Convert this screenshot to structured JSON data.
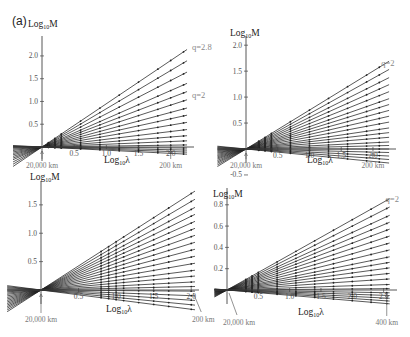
{
  "figure": {
    "label": "(a)"
  },
  "chart_data": [
    {
      "type": "line",
      "panel": "top-left",
      "ylabel": "Log10M",
      "xlabel": "Log10λ",
      "xlim": [
        -0.45,
        2.3
      ],
      "ylim": [
        -0.2,
        2.35
      ],
      "xticks": [
        0.5,
        1.0,
        1.5,
        2.0
      ],
      "xtick_labels": [
        "0.5",
        "1.0",
        "1.5",
        "2.0"
      ],
      "yticks": [
        0.5,
        1.0,
        1.5,
        2.0
      ],
      "ytick_labels": [
        "0.5",
        "1.0",
        "1.5",
        "2.0"
      ],
      "annotations": [
        {
          "text": "q=2.8",
          "x": 2.3,
          "y": 2.2
        },
        {
          "text": "q=2",
          "x": 2.3,
          "y": 1.15
        },
        {
          "text": "20,000 km",
          "x": 0.0,
          "arrow": "up"
        },
        {
          "text": "200 km",
          "x": 2.0,
          "arrow": "up"
        }
      ],
      "series_description": "Fan of straight lines through origin (Log10λ=0, Log10M=0); slopes range from about -0.08 to 0.95 (q from ~1 to 2.8); dots mark sample points",
      "slopes": [
        0.95,
        0.84,
        0.73,
        0.62,
        0.54,
        0.46,
        0.38,
        0.31,
        0.24,
        0.17,
        0.11,
        0.06,
        0.02,
        -0.01,
        -0.03,
        -0.05,
        -0.07
      ],
      "sample_x": [
        0.1,
        0.2,
        0.3,
        0.6,
        0.9,
        1.2,
        1.5,
        1.8,
        2.0,
        2.2
      ]
    },
    {
      "type": "line",
      "panel": "top-right",
      "ylabel": "Log10M",
      "xlabel": "Log10λ",
      "xlim": [
        -0.45,
        2.3
      ],
      "ylim": [
        -0.55,
        2.1
      ],
      "xticks": [
        0.5,
        1.0,
        1.5,
        2.0
      ],
      "xtick_labels": [
        "0.5",
        "1.0",
        "1.5",
        "2.0"
      ],
      "yticks": [
        -0.5,
        0.5,
        1.0,
        1.5,
        2.0
      ],
      "ytick_labels": [
        "-0.5",
        "0.5",
        "1.0",
        "1.5",
        "2.0"
      ],
      "annotations": [
        {
          "text": "q=2",
          "x": 2.1,
          "y": 1.65
        },
        {
          "text": "20,000 km",
          "x": 0.0,
          "arrow": "up"
        },
        {
          "text": "200 km",
          "x": 2.0,
          "arrow": "up"
        }
      ],
      "series_description": "Fan of lines through origin with vertical jumps near Log10λ≈0.2–0.45; slopes approx 0.75 down to -0.12",
      "slopes": [
        0.75,
        0.68,
        0.61,
        0.55,
        0.49,
        0.43,
        0.38,
        0.33,
        0.28,
        0.23,
        0.18,
        0.14,
        0.1,
        0.06,
        0.03,
        0.0,
        -0.03,
        -0.06,
        -0.09,
        -0.12
      ],
      "sample_x": [
        0.2,
        0.3,
        0.4,
        0.7,
        1.0,
        1.3,
        1.6,
        1.9,
        2.1
      ]
    },
    {
      "type": "line",
      "panel": "bottom-left",
      "ylabel": "Log10M",
      "xlabel": "Log10λ",
      "xlim": [
        -0.45,
        2.05
      ],
      "ylim": [
        -0.3,
        1.85
      ],
      "xticks": [
        0.5,
        1.0,
        1.5,
        2.0
      ],
      "xtick_labels": [
        "0.5",
        "1.0",
        "1.5",
        "2.0"
      ],
      "yticks": [
        0.5,
        1.0,
        1.5
      ],
      "ytick_labels": [
        "0.5",
        "1.0",
        "1.5"
      ],
      "annotations": [
        {
          "text": "20,000 km",
          "x": 0.0,
          "arrow": "up"
        },
        {
          "text": "200 km",
          "x": 2.0,
          "arrow": "diag"
        }
      ],
      "series_description": "Fan of lines through origin with zigzag bumps near Log10λ≈0.8–1.3; slopes approx 0.85 down to -0.17",
      "slopes": [
        0.85,
        0.78,
        0.71,
        0.65,
        0.59,
        0.53,
        0.47,
        0.41,
        0.35,
        0.29,
        0.23,
        0.17,
        0.12,
        0.07,
        0.03,
        -0.01,
        -0.05,
        -0.09,
        -0.13,
        -0.17
      ],
      "sample_x": [
        0.8,
        0.9,
        1.0,
        1.1,
        1.3,
        1.5,
        1.7,
        2.0
      ]
    },
    {
      "type": "line",
      "panel": "bottom-right",
      "ylabel": "Log10M",
      "xlabel": "Log10λ",
      "xlim": [
        -0.2,
        2.65
      ],
      "ylim": [
        -0.15,
        0.92
      ],
      "xticks": [
        0.5,
        1.0,
        1.5,
        2.0,
        2.5
      ],
      "xtick_labels": [
        "0.5",
        "1.0",
        "1.5",
        "2.0",
        "2.5"
      ],
      "yticks": [
        0.2,
        0.4,
        0.6,
        0.8
      ],
      "ytick_labels": [
        "0.2",
        "0.4",
        "0.6",
        "0.8"
      ],
      "annotations": [
        {
          "text": "q=2",
          "x": 2.5,
          "y": 0.85
        },
        {
          "text": "20,000 km",
          "x": 0.0,
          "arrow": "diag"
        },
        {
          "text": "400 km",
          "x": 2.55,
          "arrow": "up"
        }
      ],
      "series_description": "Fan of lines through origin with small vertical jumps near Log10λ≈0.3–0.5; slopes approx 0.33 down to -0.05",
      "slopes": [
        0.33,
        0.3,
        0.27,
        0.245,
        0.22,
        0.195,
        0.17,
        0.145,
        0.12,
        0.1,
        0.08,
        0.06,
        0.04,
        0.02,
        0.005,
        -0.01,
        -0.02,
        -0.03,
        -0.04,
        -0.05
      ],
      "sample_x": [
        0.3,
        0.4,
        0.5,
        0.8,
        1.1,
        1.4,
        1.7,
        2.0,
        2.3,
        2.55
      ]
    }
  ]
}
